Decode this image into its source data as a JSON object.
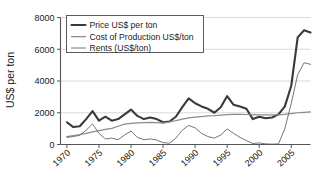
{
  "chart_data": {
    "type": "line",
    "title": "",
    "xlabel": "",
    "ylabel": "US$ per ton",
    "xlim": [
      1969,
      2008
    ],
    "ylim": [
      0,
      8000
    ],
    "grid": true,
    "legend_position": "top-left",
    "xticks": [
      "1970",
      "1975",
      "1980",
      "1985",
      "1990",
      "1995",
      "2000",
      "2005"
    ],
    "xtick_values": [
      1970,
      1975,
      1980,
      1985,
      1990,
      1995,
      2000,
      2005
    ],
    "yticks": [
      "0",
      "2000",
      "4000",
      "6000",
      "8000"
    ],
    "ytick_values": [
      0,
      2000,
      4000,
      6000,
      8000
    ],
    "x": [
      1970,
      1971,
      1972,
      1973,
      1974,
      1975,
      1976,
      1977,
      1978,
      1979,
      1980,
      1981,
      1982,
      1983,
      1984,
      1985,
      1986,
      1987,
      1988,
      1989,
      1990,
      1991,
      1992,
      1993,
      1994,
      1995,
      1996,
      1997,
      1998,
      1999,
      2000,
      2001,
      2002,
      2003,
      2004,
      2005,
      2006,
      2007,
      2008
    ],
    "series": [
      {
        "name": "Price US$ per ton",
        "color": "#3a3a3a",
        "linewidth": 2.1,
        "values": [
          1400,
          1100,
          1150,
          1600,
          2100,
          1500,
          1750,
          1500,
          1600,
          1900,
          2200,
          1800,
          1600,
          1700,
          1600,
          1400,
          1450,
          1750,
          2350,
          2900,
          2600,
          2400,
          2250,
          2000,
          2350,
          3050,
          2500,
          2400,
          2250,
          1600,
          1750,
          1650,
          1700,
          1900,
          2400,
          3700,
          6750,
          7200,
          7050
        ]
      },
      {
        "name": "Cost of Production US$/ton",
        "color": "#8c8c8c",
        "linewidth": 1.25,
        "values": [
          500,
          560,
          620,
          700,
          800,
          880,
          950,
          1020,
          1150,
          1280,
          1330,
          1360,
          1380,
          1400,
          1380,
          1350,
          1420,
          1500,
          1600,
          1680,
          1720,
          1760,
          1800,
          1820,
          1850,
          1880,
          1900,
          1900,
          1890,
          1880,
          1870,
          1860,
          1860,
          1870,
          1900,
          1950,
          2000,
          2030,
          2050
        ]
      },
      {
        "name": "Rents (US$/ton)",
        "color": "#6e6e6e",
        "linewidth": 0.95,
        "values": [
          450,
          500,
          580,
          900,
          1300,
          700,
          350,
          400,
          300,
          600,
          850,
          450,
          300,
          350,
          280,
          120,
          80,
          400,
          900,
          1200,
          1050,
          700,
          500,
          400,
          600,
          980,
          700,
          450,
          250,
          60,
          100,
          40,
          20,
          40,
          1000,
          2600,
          4400,
          5150,
          5050
        ]
      }
    ]
  },
  "legend": {
    "items": [
      {
        "label": "Price US$ per ton"
      },
      {
        "label": "Cost of Production US$/ton"
      },
      {
        "label": "Rents (US$/ton)"
      }
    ]
  },
  "axes": {
    "y_title": "US$ per ton"
  }
}
